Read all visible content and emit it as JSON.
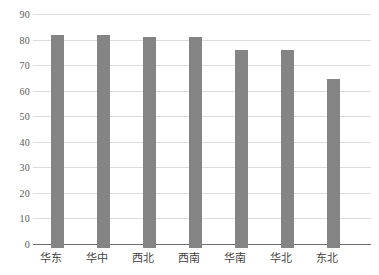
{
  "chart_data": {
    "type": "bar",
    "title": "",
    "subtitle": "",
    "xlabel": "",
    "ylabel": "",
    "categories": [
      "华东",
      "华中",
      "西北",
      "西南",
      "华南",
      "华北",
      "东北"
    ],
    "values": [
      82,
      82,
      81,
      81,
      76,
      76,
      65
    ],
    "series": [
      {
        "name": "",
        "values": [
          82,
          82,
          81,
          81,
          76,
          76,
          65
        ]
      }
    ],
    "ylim": [
      0,
      90
    ],
    "yticks": [
      0,
      10,
      20,
      30,
      40,
      50,
      60,
      70,
      80,
      90
    ],
    "ytick_labels": [
      "0",
      "10",
      "20",
      "30",
      "40",
      "50",
      "60",
      "70",
      "80",
      "90"
    ],
    "grid": true,
    "grid_axis": "y",
    "legend": false,
    "legend_position": "none",
    "bar_color": "#848484",
    "gridline_color": "#dcdcdc",
    "axis_color": "#6e6e6e",
    "background_color": "#ffffff",
    "annotations": []
  }
}
